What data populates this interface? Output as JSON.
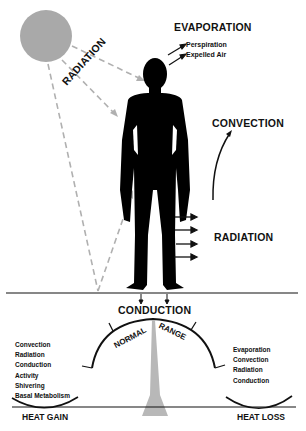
{
  "diagram": {
    "labels": {
      "evaporation": "EVAPORATION",
      "perspiration": "Perspiration",
      "expelled_air": "Expelled Air",
      "radiation_sun": "RADIATION",
      "convection": "CONVECTION",
      "radiation_body": "RADIATION",
      "conduction": "CONDUCTION",
      "normal": "NORMAL",
      "range": "RANGE",
      "heat_gain": "HEAT GAIN",
      "heat_loss": "HEAT LOSS"
    },
    "heat_gain_factors": [
      "Convection",
      "Radiation",
      "Conduction",
      "Activity",
      "Shivering",
      "Basal Metabolism"
    ],
    "heat_loss_factors": [
      "Evaporation",
      "Convection",
      "Radiation",
      "Conduction"
    ],
    "colors": {
      "sun": "#a9a9a9",
      "figure": "#000000",
      "dashed_rays": "#b0b0b0",
      "balance_pointer": "#b8b8b8",
      "lines": "#111111"
    }
  }
}
